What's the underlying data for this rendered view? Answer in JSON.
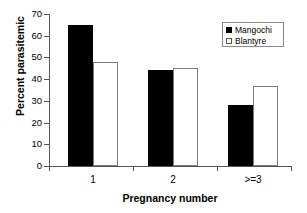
{
  "chart_data": {
    "type": "bar",
    "title": "",
    "xlabel": "Pregnancy number",
    "ylabel": "Percent parasitemic",
    "categories": [
      "1",
      "2",
      ">=3"
    ],
    "series": [
      {
        "name": "Mangochi",
        "color": "#000000",
        "values": [
          65,
          44,
          28
        ]
      },
      {
        "name": "Blantyre",
        "color": "#ffffff",
        "values": [
          48,
          45,
          37
        ]
      }
    ],
    "ylim": [
      0,
      70
    ],
    "yticks": [
      0,
      10,
      20,
      30,
      40,
      50,
      60,
      70
    ],
    "ytick_labels": [
      "0",
      "10",
      "20",
      "30",
      "40",
      "50",
      "60",
      "70"
    ],
    "grid": false,
    "legend_position": "top-right"
  }
}
